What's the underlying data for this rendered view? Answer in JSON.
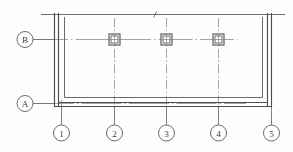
{
  "drawing": {
    "type": "architectural-floor-plan",
    "title": "",
    "background_color": "#fefefe",
    "line_color": "#555555",
    "wall_color": "#4a4a4a",
    "grid_color": "#8a8a8a",
    "text_color": "#3a3a3a"
  },
  "grid_bubbles": {
    "horizontal_axis_label": "Vertical grid lines numbered",
    "vertical_axis_label": "Horizontal grid lines lettered",
    "letters": [
      {
        "label": "B",
        "cx": 25,
        "cy": 39,
        "r": 8
      },
      {
        "label": "A",
        "cx": 25,
        "cy": 100,
        "r": 8
      }
    ],
    "numbers": [
      {
        "label": "1",
        "cx": 61,
        "cy": 133,
        "r": 8
      },
      {
        "label": "2",
        "cx": 114,
        "cy": 133,
        "r": 8
      },
      {
        "label": "3",
        "cx": 166,
        "cy": 133,
        "r": 8
      },
      {
        "label": "4",
        "cx": 218,
        "cy": 133,
        "r": 8
      },
      {
        "label": "5",
        "cx": 271,
        "cy": 133,
        "r": 8
      }
    ]
  },
  "columns": [
    {
      "name": "column-grid-2-B",
      "cx": 114,
      "cy": 39,
      "size": 11
    },
    {
      "name": "column-grid-3-B",
      "cx": 166,
      "cy": 39,
      "size": 11
    },
    {
      "name": "column-grid-4-B",
      "cx": 218,
      "cy": 39,
      "size": 11
    }
  ],
  "walls": {
    "left": {
      "x_outer": 54,
      "x_inner": 58,
      "y_top": 14,
      "y_bottom": 106
    },
    "right": {
      "x_outer": 271,
      "x_inner": 267,
      "y_top": 14,
      "y_bottom": 106
    },
    "bottom": {
      "y_outer": 106,
      "y_inner": 102,
      "x_left": 54,
      "x_right": 271
    },
    "inner_offset_line": {
      "inset": 6
    }
  },
  "top_line": {
    "x_start": 41,
    "x_end": 285,
    "y": 14,
    "break_mark_x": 155
  }
}
